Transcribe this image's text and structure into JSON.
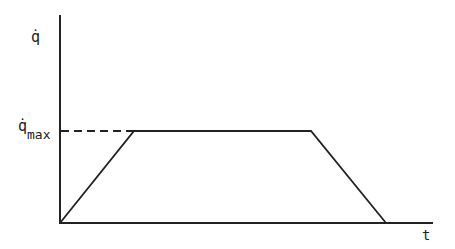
{
  "diagram": {
    "type": "velocity-profile",
    "y_axis_label": "q̇",
    "x_axis_label": "t",
    "level_label_main": "q̇",
    "level_label_sub": "max",
    "colors": {
      "line": "#222222",
      "background": "#ffffff"
    },
    "points": [
      {
        "x": 60,
        "y": 223
      },
      {
        "x": 134,
        "y": 131
      },
      {
        "x": 311,
        "y": 131
      },
      {
        "x": 386,
        "y": 223
      }
    ],
    "axes": {
      "origin": {
        "x": 60,
        "y": 223
      },
      "y_top": 15,
      "x_end": 433
    },
    "dashed_reference": {
      "from_x": 60,
      "to_x": 134,
      "y": 131
    }
  }
}
